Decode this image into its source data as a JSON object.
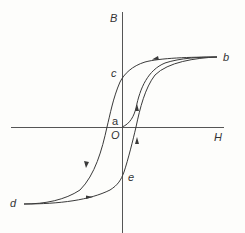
{
  "diagram": {
    "type": "hysteresis-loop",
    "axes": {
      "x_label": "H",
      "y_label": "B",
      "origin_label": "O"
    },
    "points": {
      "a": "a",
      "b": "b",
      "c": "c",
      "d": "d",
      "e": "e"
    },
    "colors": {
      "line": "#3a3a3a",
      "axis": "#555555",
      "background": "#fdfdfb"
    }
  }
}
